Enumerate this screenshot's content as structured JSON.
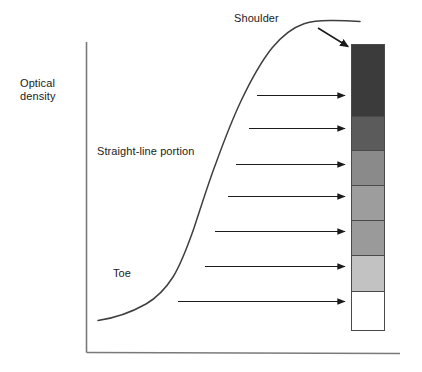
{
  "figure": {
    "axes": {
      "y_label_line1": "Optical",
      "y_label_line2": "density",
      "y_axis_color": "#6b6b6b",
      "x_axis_color": "#6b6b6b"
    },
    "annotations": [
      {
        "id": "shoulder",
        "text": "Shoulder"
      },
      {
        "id": "straight-line",
        "text": "Straight-line portion"
      },
      {
        "id": "toe",
        "text": "Toe"
      }
    ],
    "curve": {
      "color": "#3f3f3f",
      "description": "S-shaped sensitometric curve with toe, straight-line portion and shoulder"
    },
    "pointer_arrow": {
      "color": "#1b1b1b",
      "from_label": "Shoulder",
      "to_target": "swatch-1"
    },
    "mapping_arrows": {
      "count": 7,
      "color": "#1b1b1b",
      "direction": "right"
    },
    "swatches": [
      {
        "id": "swatch-1",
        "name": "step-1-darkest",
        "color": "#3c3b3b",
        "height": 72
      },
      {
        "id": "swatch-2",
        "name": "step-2",
        "color": "#5b5b5b",
        "height": 34
      },
      {
        "id": "swatch-3",
        "name": "step-3",
        "color": "#8a8a8a",
        "height": 35
      },
      {
        "id": "swatch-4",
        "name": "step-4",
        "color": "#9d9d9d",
        "height": 35
      },
      {
        "id": "swatch-5",
        "name": "step-5",
        "color": "#9a9a9a",
        "height": 35
      },
      {
        "id": "swatch-6",
        "name": "step-6",
        "color": "#c2c2c2",
        "height": 36
      },
      {
        "id": "swatch-7",
        "name": "step-7-white",
        "color": "#ffffff",
        "height": 38
      }
    ]
  },
  "chart_data": {
    "type": "line",
    "title": "",
    "xlabel": "",
    "ylabel": "Optical density",
    "grid": false,
    "legend": null,
    "annotations": [
      "Toe",
      "Straight-line portion",
      "Shoulder"
    ],
    "series": [
      {
        "name": "Characteristic curve",
        "x": [
          98,
          120,
          140,
          155,
          168,
          178,
          188,
          198,
          210,
          225,
          245,
          268,
          290,
          310,
          330,
          360
        ],
        "y": [
          320,
          315,
          308,
          300,
          288,
          272,
          250,
          222,
          190,
          150,
          105,
          66,
          40,
          27,
          22,
          21
        ]
      }
    ]
  }
}
